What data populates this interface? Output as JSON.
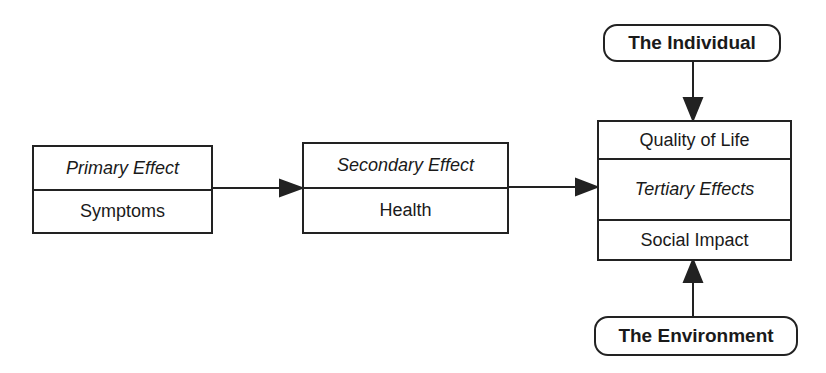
{
  "diagram": {
    "primary": {
      "title": "Primary Effect",
      "label": "Symptoms"
    },
    "secondary": {
      "title": "Secondary Effect",
      "label": "Health"
    },
    "tertiary": {
      "top": "Quality of Life",
      "title": "Tertiary Effects",
      "bottom": "Social Impact"
    },
    "individual": "The Individual",
    "environment": "The Environment"
  },
  "colors": {
    "line": "#222222",
    "background": "#ffffff"
  }
}
